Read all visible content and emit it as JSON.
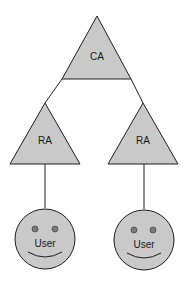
{
  "diagram": {
    "title": "",
    "colors": {
      "fill": "#c9c9c9",
      "stroke": "#1e1e1e",
      "background": "#ffffff"
    },
    "nodes": [
      {
        "id": "ca",
        "shape": "triangle",
        "label": "CA"
      },
      {
        "id": "ra-left",
        "shape": "triangle",
        "label": "RA"
      },
      {
        "id": "ra-right",
        "shape": "triangle",
        "label": "RA"
      },
      {
        "id": "user-left",
        "shape": "smiley-circle",
        "label": "User"
      },
      {
        "id": "user-right",
        "shape": "smiley-circle",
        "label": "User"
      }
    ],
    "edges": [
      {
        "from": "ca",
        "to": "ra-left"
      },
      {
        "from": "ca",
        "to": "ra-right"
      },
      {
        "from": "ra-left",
        "to": "user-left"
      },
      {
        "from": "ra-right",
        "to": "user-right"
      }
    ]
  }
}
